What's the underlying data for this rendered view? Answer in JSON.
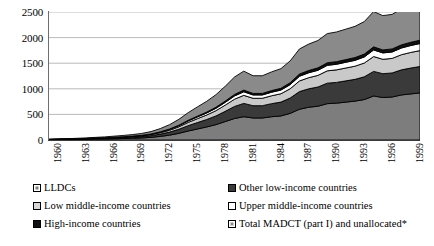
{
  "chart_data": {
    "type": "area",
    "title": "",
    "subtitle": "",
    "xlabel": "",
    "ylabel": "",
    "stacked": true,
    "grid": true,
    "legend_position": "bottom",
    "ylim": [
      0,
      2500
    ],
    "yticks": [
      0,
      500,
      1000,
      1500,
      2000,
      2500
    ],
    "ytick_labels": [
      "0",
      "500",
      "1000",
      "1500",
      "2000",
      "2500"
    ],
    "xlim": [
      1960,
      2000
    ],
    "x": [
      1960,
      1961,
      1962,
      1963,
      1964,
      1965,
      1966,
      1967,
      1968,
      1969,
      1970,
      1971,
      1972,
      1973,
      1974,
      1975,
      1976,
      1977,
      1978,
      1979,
      1980,
      1981,
      1982,
      1983,
      1984,
      1985,
      1986,
      1987,
      1988,
      1989,
      1990,
      1991,
      1992,
      1993,
      1994,
      1995,
      1996,
      1997,
      1998,
      1999,
      2000
    ],
    "xtick_labels": [
      "1960",
      "1963",
      "1966",
      "1969",
      "1972",
      "1975",
      "1978",
      "1981",
      "1984",
      "1987",
      "1990",
      "1993",
      "1996",
      "1999"
    ],
    "xticks": [
      1960,
      1963,
      1966,
      1969,
      1972,
      1975,
      1978,
      1981,
      1984,
      1987,
      1990,
      1993,
      1996,
      1999
    ],
    "series": [
      {
        "name": "LLDCs",
        "color": "#7d7d7d",
        "values": [
          5,
          7,
          9,
          11,
          14,
          17,
          20,
          24,
          28,
          33,
          40,
          52,
          70,
          95,
          130,
          175,
          215,
          255,
          300,
          360,
          420,
          455,
          430,
          430,
          455,
          470,
          520,
          600,
          640,
          660,
          710,
          720,
          740,
          760,
          790,
          860,
          830,
          840,
          880,
          900,
          920
        ]
      },
      {
        "name": "Other low-income countries",
        "color": "#3a3a3a",
        "values": [
          3,
          4,
          5,
          6,
          8,
          10,
          12,
          15,
          18,
          21,
          26,
          33,
          45,
          60,
          80,
          105,
          125,
          145,
          170,
          200,
          235,
          260,
          240,
          240,
          255,
          270,
          300,
          345,
          360,
          375,
          400,
          405,
          415,
          425,
          445,
          480,
          465,
          470,
          490,
          505,
          515
        ]
      },
      {
        "name": "Low middle-income countries",
        "color": "#c9c9c9",
        "values": [
          2,
          2,
          3,
          4,
          5,
          6,
          7,
          9,
          11,
          13,
          16,
          20,
          27,
          36,
          48,
          63,
          76,
          88,
          103,
          121,
          142,
          157,
          145,
          145,
          154,
          163,
          181,
          208,
          217,
          227,
          241,
          245,
          251,
          257,
          269,
          290,
          281,
          284,
          296,
          305,
          311
        ]
      },
      {
        "name": "Upper middle-income countries",
        "color": "#ffffff",
        "values": [
          1,
          1,
          1,
          2,
          2,
          3,
          3,
          4,
          5,
          6,
          7,
          9,
          12,
          16,
          21,
          28,
          34,
          39,
          46,
          54,
          63,
          70,
          65,
          65,
          69,
          72,
          80,
          92,
          96,
          100,
          107,
          109,
          112,
          114,
          119,
          129,
          125,
          126,
          131,
          135,
          138
        ]
      },
      {
        "name": "High-income countries",
        "color": "#111111",
        "values": [
          0,
          0,
          1,
          1,
          1,
          1,
          2,
          2,
          2,
          3,
          3,
          4,
          6,
          8,
          10,
          13,
          16,
          18,
          21,
          25,
          30,
          33,
          30,
          30,
          32,
          34,
          38,
          43,
          45,
          47,
          50,
          51,
          52,
          54,
          56,
          60,
          58,
          59,
          61,
          63,
          65
        ]
      },
      {
        "name": "Total MADCT (part I) and unallocated*",
        "color": "#8a8a8a",
        "values": [
          4,
          5,
          7,
          9,
          11,
          14,
          17,
          21,
          25,
          30,
          36,
          47,
          63,
          85,
          115,
          150,
          180,
          210,
          245,
          290,
          340,
          370,
          345,
          345,
          365,
          385,
          425,
          490,
          515,
          535,
          570,
          580,
          595,
          610,
          635,
          690,
          670,
          675,
          705,
          725,
          740
        ]
      }
    ]
  },
  "legend": {
    "items": [
      {
        "label": "LLDCs",
        "swatch": "gray-inner",
        "color": "#7d7d7d"
      },
      {
        "label": "Other low-income countries",
        "swatch": "dark",
        "color": "#3a3a3a"
      },
      {
        "label": "Low middle-income countries",
        "swatch": "light",
        "color": "#d6d6d6"
      },
      {
        "label": "Upper middle-income countries",
        "swatch": "white",
        "color": "#ffffff"
      },
      {
        "label": "High-income countries",
        "swatch": "black",
        "color": "#111111"
      },
      {
        "label": "Total MADCT (part I) and unallocated*",
        "swatch": "gray-inner",
        "color": "#8a8a8a"
      }
    ]
  }
}
